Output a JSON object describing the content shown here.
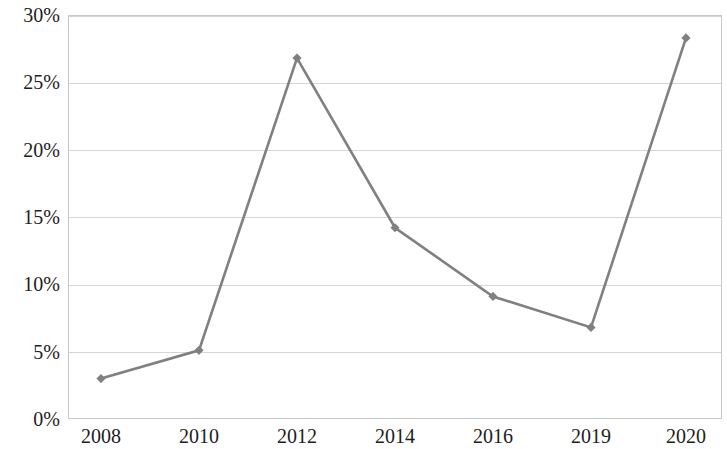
{
  "chart_data": {
    "type": "line",
    "title": "",
    "subtitle": "",
    "xlabel": "",
    "ylabel": "",
    "categories": [
      "2008",
      "2010",
      "2012",
      "2014",
      "2016",
      "2019",
      "2020"
    ],
    "values": [
      3.0,
      5.1,
      26.8,
      14.2,
      9.1,
      6.8,
      28.3
    ],
    "series": [
      {
        "name": "",
        "values": [
          3.0,
          5.1,
          26.8,
          14.2,
          9.1,
          6.8,
          28.3
        ]
      }
    ],
    "y_tick_labels": [
      "0%",
      "5%",
      "10%",
      "15%",
      "20%",
      "25%",
      "30%"
    ],
    "y_tick_values": [
      0,
      5,
      10,
      15,
      20,
      25,
      30
    ],
    "ylim": [
      0,
      30
    ],
    "y_unit": "%",
    "grid": "horizontal",
    "legend": "none",
    "marker": "diamond",
    "line_color": "#808080",
    "marker_color": "#808080",
    "gridline_color": "#d6d6d6",
    "axis_color": "#c8c8c8",
    "text_color": "#1d1d1d",
    "background_color": "#ffffff"
  }
}
